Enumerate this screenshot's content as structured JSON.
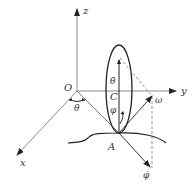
{
  "figure": {
    "colors": {
      "axis": "#8a8a8a",
      "stroke": "#222222",
      "dashed": "#777777",
      "label": "#333333",
      "background": "#ffffff"
    },
    "axes": {
      "origin_label": "O",
      "x_label": "x",
      "y_label": "y",
      "z_label": "z"
    },
    "angles": {
      "theta": "θ",
      "phi": "φ"
    },
    "points": {
      "center": "C",
      "contact": "A"
    },
    "vectors": {
      "theta_dot": "θ̇",
      "omega": "ω",
      "phi_dot": "φ̇"
    }
  }
}
